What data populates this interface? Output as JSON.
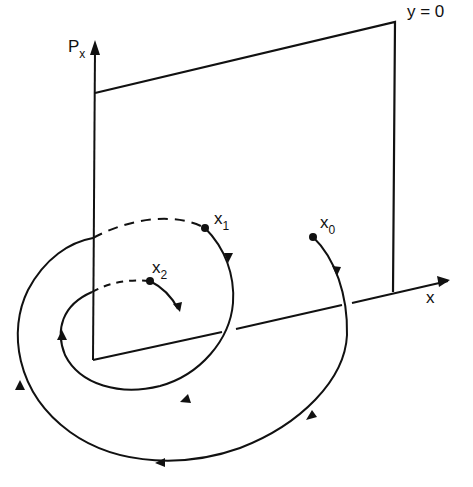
{
  "figure": {
    "axes": {
      "vertical_label": "P",
      "vertical_sub": "x",
      "horizontal_label": "x"
    },
    "plane_label": "y = 0",
    "points": [
      {
        "id": "x0",
        "label": "x",
        "sub": "0"
      },
      {
        "id": "x1",
        "label": "x",
        "sub": "1"
      },
      {
        "id": "x2",
        "label": "x",
        "sub": "2"
      }
    ],
    "colors": {
      "ink": "#111111",
      "background": "#ffffff"
    }
  }
}
